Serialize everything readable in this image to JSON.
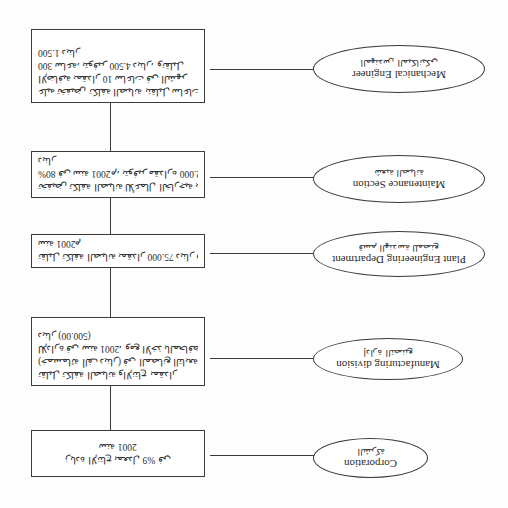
{
  "orientation": "rotated-180",
  "diagram": {
    "nodes": [
      {
        "english": "Corporation",
        "arabic": "الشركة",
        "details": [
          "زيادة الإنتاج بمعدل 9% في",
          "سنة 2001"
        ]
      },
      {
        "english": "Manufacturing division",
        "arabic": "إدارة التصنيع",
        "details": [
          "تقليل تكلفة الصيانة والإنتاج بمقدار",
          "(خمسمائة ألف دينار) في المصانع التابعة",
          "للإدارة في سنة 2001، ومع الأخذ بالمحافظة على",
          "دينار (500.00)"
        ]
      },
      {
        "english": "Plant Engineering Department",
        "arabic": "قسم الهندسة للمصنع",
        "details": [
          "تقليل تكلفة الصيانة بمقدار 75.000 دينار في",
          "سنة 2001م"
        ]
      },
      {
        "english": "Maintenance Section",
        "arabic": "شعبة الصيانة",
        "details": [
          "تخفيض تكلفة الصيانة للأعمال الخارجية بنسبة",
          "80% في سنة 2001م، بتوفير مقداره 12.000",
          "دينار"
        ]
      },
      {
        "english": "Mechanical Engineer",
        "arabic": "المهندس الميكانيكي",
        "details": [
          "عليه تخفيض تكلفة الصيانة بتقليل ساعات العمل",
          "الإضافية بمقدار 10 ساعات في الشهر",
          "300 ساعة، بتوفير 4.500 دينار، وتقليل",
          "1.500 دينار"
        ]
      }
    ]
  }
}
